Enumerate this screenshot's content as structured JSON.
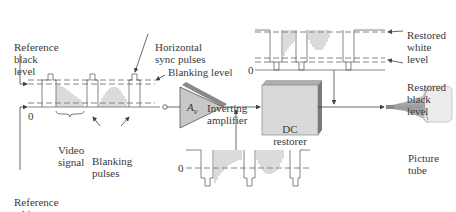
{
  "labels": {
    "ref_black": [
      "Reference",
      "black",
      "level"
    ],
    "h_sync": [
      "Horizontal",
      "sync pulses"
    ],
    "blanking_level": "Blanking level",
    "inverting_amp": [
      "Inverting",
      "amplifier"
    ],
    "zero_left": "0",
    "video_signal": [
      "Video",
      "signal"
    ],
    "blanking_pulses": [
      "Blanking",
      "pulses"
    ],
    "ref_white": [
      "Reference",
      "white",
      "level"
    ],
    "amp_gain": "A",
    "amp_gain_sub": "v",
    "dc_restorer": [
      "DC",
      "restorer"
    ],
    "restored_white": [
      "Restored",
      "white",
      "level"
    ],
    "restored_black": [
      "Restored",
      "black",
      "level"
    ],
    "zero_right": "0",
    "zero_bottom": "0",
    "picture_tube": [
      "Picture",
      "tube"
    ]
  },
  "colors": {
    "line": "#555555",
    "block_fill": "#d9d9d9",
    "block_side": "#8a8a8a",
    "amp_fill": "#c8c8c8",
    "tube": "#bdbdbd"
  }
}
